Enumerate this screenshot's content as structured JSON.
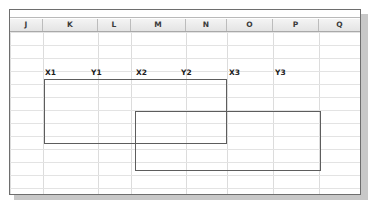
{
  "app": {
    "type": "spreadsheet",
    "window_title": ""
  },
  "grid": {
    "column_headers": [
      "J",
      "K",
      "L",
      "M",
      "N",
      "O",
      "P",
      "Q"
    ],
    "column_edges_px": [
      9,
      42,
      97,
      130,
      185,
      226,
      272,
      318,
      360
    ],
    "row_line_spacing_px": 13,
    "row_count_visible": 13,
    "grid_line_color": "#dcdcdc",
    "header_text_color": "#3a3a3a",
    "header_fill_start": "#f4f4f4",
    "header_fill_end": "#e4e4e4"
  },
  "labels": [
    {
      "text": "X1",
      "col": "K",
      "x": 44,
      "y": 67
    },
    {
      "text": "Y1",
      "col": "L",
      "x": 90,
      "y": 67
    },
    {
      "text": "X2",
      "col": "M",
      "x": 135,
      "y": 67
    },
    {
      "text": "Y2",
      "col": "N",
      "x": 180,
      "y": 67
    },
    {
      "text": "X3",
      "col": "O",
      "x": 228,
      "y": 67
    },
    {
      "text": "Y3",
      "col": "P",
      "x": 274,
      "y": 67
    }
  ],
  "shapes": {
    "stroke_color": "#5d5d5d",
    "fill": "none",
    "rectangles": [
      {
        "name": "rectangle-1",
        "left": 43,
        "top": 78,
        "width": 183,
        "height": 65
      },
      {
        "name": "rectangle-2",
        "left": 134,
        "top": 110,
        "width": 92,
        "height": 33
      },
      {
        "name": "rectangle-3",
        "left": 134,
        "top": 110,
        "width": 186,
        "height": 60
      }
    ]
  },
  "window": {
    "border_color": "#6e6e6e",
    "shadow_color": "#9a9a9a",
    "background": "#ffffff"
  }
}
